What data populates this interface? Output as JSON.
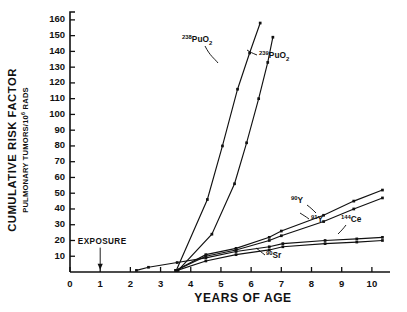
{
  "chart_data": {
    "type": "line",
    "title": "",
    "xlabel": "YEARS OF AGE",
    "ylabel": "CUMULATIVE RISK FACTOR",
    "ylabel_sub": "PULMONARY TUMORS/10⁶ RADS",
    "xlim": [
      0,
      10.6
    ],
    "ylim": [
      0,
      165
    ],
    "ytick_values": [
      10,
      20,
      30,
      40,
      50,
      60,
      70,
      80,
      90,
      100,
      110,
      120,
      130,
      140,
      150,
      160
    ],
    "ytick_labels": [
      "10",
      "20",
      "30",
      "40",
      "50",
      "60",
      "70",
      "80",
      "90",
      "100",
      "110",
      "120",
      "130",
      "140",
      "150",
      "160"
    ],
    "xtick_values": [
      0,
      1,
      2,
      3,
      4,
      5,
      6,
      7,
      8,
      9,
      10
    ],
    "xtick_labels": [
      "0",
      "1",
      "2",
      "3",
      "4",
      "5",
      "6",
      "7",
      "8",
      "9",
      "10"
    ],
    "grid": false,
    "legend_position": "inline-annotations",
    "annotations": [
      {
        "name": "exposure",
        "text": "EXPOSURE",
        "x": 1.0,
        "y": 18,
        "arrow_to_y": 2
      }
    ],
    "series": [
      {
        "name": "238PuO2",
        "label_main": "PuO",
        "label_sup": "238",
        "label_sub": "2",
        "points": [
          {
            "x": 3.52,
            "y": 1
          },
          {
            "x": 4.55,
            "y": 46
          },
          {
            "x": 5.05,
            "y": 80
          },
          {
            "x": 5.55,
            "y": 116
          },
          {
            "x": 5.95,
            "y": 139
          },
          {
            "x": 6.3,
            "y": 158
          }
        ]
      },
      {
        "name": "239PuO2",
        "label_main": "PuO",
        "label_sup": "239",
        "label_sub": "2",
        "points": [
          {
            "x": 3.58,
            "y": 1
          },
          {
            "x": 4.7,
            "y": 24
          },
          {
            "x": 5.45,
            "y": 56
          },
          {
            "x": 5.85,
            "y": 82
          },
          {
            "x": 6.25,
            "y": 110
          },
          {
            "x": 6.55,
            "y": 133
          },
          {
            "x": 6.72,
            "y": 149
          }
        ]
      },
      {
        "name": "90Y",
        "label_main": "Y",
        "label_sup": "90",
        "label_sub": "",
        "points": [
          {
            "x": 3.5,
            "y": 1
          },
          {
            "x": 4.5,
            "y": 11
          },
          {
            "x": 5.5,
            "y": 15
          },
          {
            "x": 6.6,
            "y": 22
          },
          {
            "x": 7.0,
            "y": 26
          },
          {
            "x": 8.4,
            "y": 36
          },
          {
            "x": 9.4,
            "y": 45
          },
          {
            "x": 10.35,
            "y": 52
          }
        ]
      },
      {
        "name": "91Y",
        "label_main": "Y",
        "label_sup": "91",
        "label_sub": "",
        "points": [
          {
            "x": 3.5,
            "y": 1
          },
          {
            "x": 4.5,
            "y": 10
          },
          {
            "x": 5.5,
            "y": 14
          },
          {
            "x": 6.6,
            "y": 20
          },
          {
            "x": 7.0,
            "y": 23
          },
          {
            "x": 8.4,
            "y": 32
          },
          {
            "x": 9.4,
            "y": 40
          },
          {
            "x": 10.35,
            "y": 47
          }
        ]
      },
      {
        "name": "144Ce",
        "label_main": "Ce",
        "label_sup": "144",
        "label_sub": "",
        "points": [
          {
            "x": 2.2,
            "y": 1
          },
          {
            "x": 2.6,
            "y": 3
          },
          {
            "x": 3.55,
            "y": 6
          },
          {
            "x": 4.5,
            "y": 9
          },
          {
            "x": 5.5,
            "y": 13
          },
          {
            "x": 6.6,
            "y": 16
          },
          {
            "x": 7.05,
            "y": 18
          },
          {
            "x": 8.45,
            "y": 20
          },
          {
            "x": 9.5,
            "y": 21
          },
          {
            "x": 10.35,
            "y": 22
          }
        ]
      },
      {
        "name": "90Sr",
        "label_main": "Sr",
        "label_sup": "90",
        "label_sub": "",
        "points": [
          {
            "x": 3.55,
            "y": 1
          },
          {
            "x": 4.5,
            "y": 7
          },
          {
            "x": 5.5,
            "y": 11
          },
          {
            "x": 6.6,
            "y": 14
          },
          {
            "x": 7.05,
            "y": 16
          },
          {
            "x": 8.45,
            "y": 18
          },
          {
            "x": 9.5,
            "y": 19
          },
          {
            "x": 10.35,
            "y": 20
          }
        ]
      }
    ]
  },
  "labels": {
    "pu238": {
      "sup": "238",
      "main": "PuO",
      "sub": "2"
    },
    "pu239": {
      "sup": "239",
      "main": "PuO",
      "sub": "2"
    },
    "y90": {
      "sup": "90",
      "main": "Y"
    },
    "y91": {
      "sup": "91",
      "main": "Y"
    },
    "ce144": {
      "sup": "144",
      "main": "Ce"
    },
    "sr90": {
      "sup": "90",
      "main": "Sr"
    }
  },
  "axis": {
    "x_title": "YEARS OF AGE",
    "y_title_main": "CUMULATIVE RISK FACTOR",
    "y_title_sub_a": "PULMONARY TUMORS/10",
    "y_title_sub_exp": "6",
    "y_title_sub_b": " RADS"
  },
  "exposure": {
    "text": "EXPOSURE"
  }
}
